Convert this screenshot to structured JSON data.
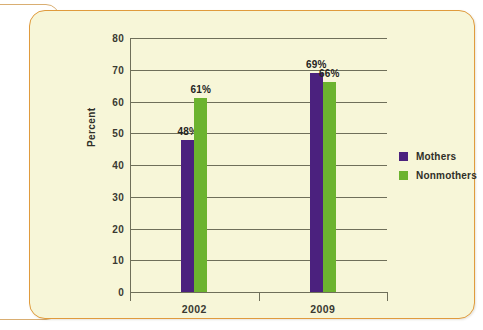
{
  "panel": {
    "background_color": "#f7f6d8",
    "border_color": "#e09b3d"
  },
  "legend": {
    "position": "right",
    "items": [
      {
        "label": "Mothers",
        "color": "#4b217e",
        "swatch_name": "legend-swatch-mothers"
      },
      {
        "label": "Nonmothers",
        "color": "#6cb32f",
        "swatch_name": "legend-swatch-nonmothers"
      }
    ]
  },
  "chart_data": {
    "type": "bar",
    "title": "",
    "xlabel": "",
    "ylabel": "Percent",
    "categories": [
      "2002",
      "2009"
    ],
    "ylim": [
      0,
      80
    ],
    "yticks": [
      0,
      10,
      20,
      30,
      40,
      50,
      60,
      70,
      80
    ],
    "ytick_labels": [
      "0",
      "10",
      "20",
      "30",
      "40",
      "50",
      "60",
      "70",
      "80"
    ],
    "grid": true,
    "series": [
      {
        "name": "Mothers",
        "color": "#4b217e",
        "values": [
          48,
          69
        ],
        "data_labels": [
          "48%",
          "69%"
        ]
      },
      {
        "name": "Nonmothers",
        "color": "#6cb32f",
        "values": [
          61,
          66
        ],
        "data_labels": [
          "61%",
          "66%"
        ]
      }
    ]
  }
}
